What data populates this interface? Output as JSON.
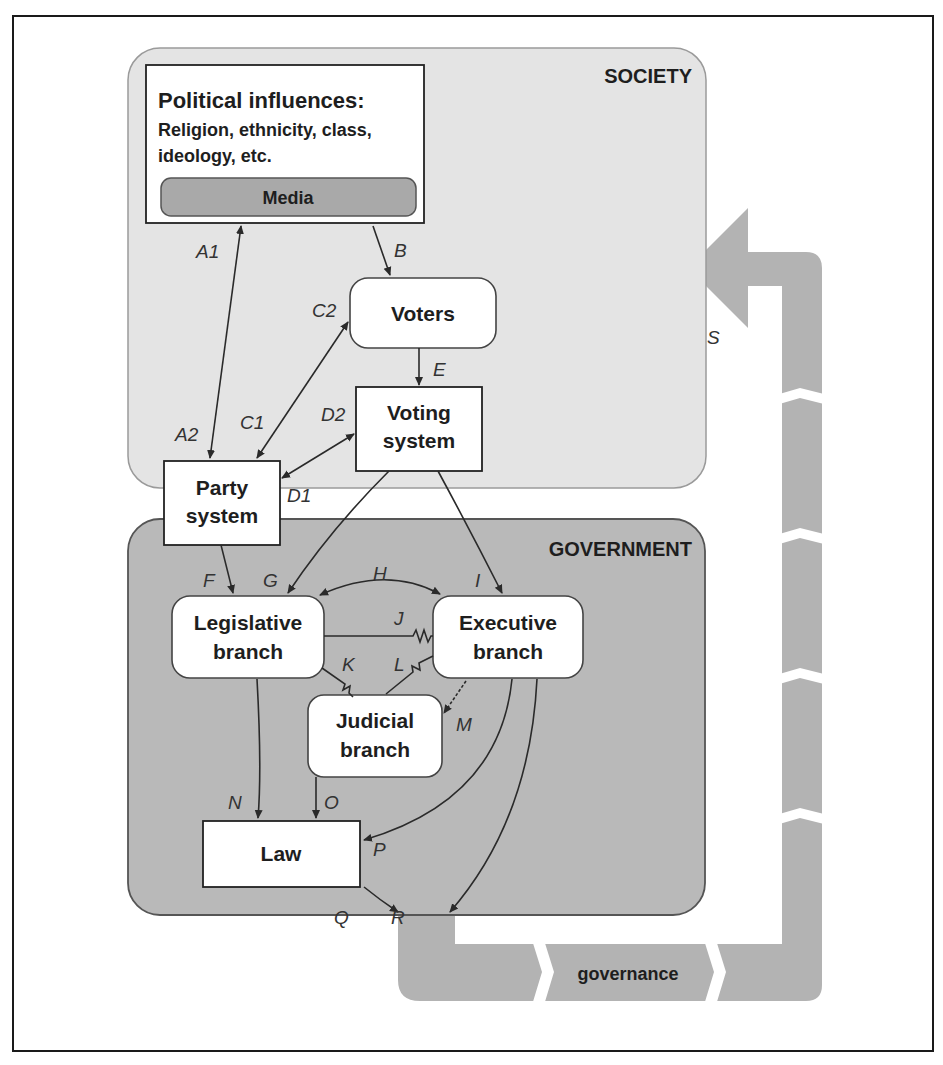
{
  "figure": {
    "regions": {
      "society": {
        "title": "SOCIETY",
        "fill": "#e4e4e4"
      },
      "government": {
        "title": "GOVERNMENT",
        "fill": "#b9b9b9"
      }
    },
    "nodes": {
      "political_influences": {
        "title": "Political influences:",
        "line1": "Religion, ethnicity, class,",
        "line2": "ideology, etc."
      },
      "media": {
        "label": "Media"
      },
      "voters": {
        "label": "Voters"
      },
      "voting_system": {
        "line1": "Voting",
        "line2": "system"
      },
      "party_system": {
        "line1": "Party",
        "line2": "system"
      },
      "legislative": {
        "line1": "Legislative",
        "line2": "branch"
      },
      "executive": {
        "line1": "Executive",
        "line2": "branch"
      },
      "judicial": {
        "line1": "Judicial",
        "line2": "branch"
      },
      "law": {
        "label": "Law"
      }
    },
    "edge_labels": {
      "A1": "A1",
      "A2": "A2",
      "B": "B",
      "C1": "C1",
      "C2": "C2",
      "D1": "D1",
      "D2": "D2",
      "E": "E",
      "F": "F",
      "G": "G",
      "H": "H",
      "I": "I",
      "J": "J",
      "K": "K",
      "L": "L",
      "M": "M",
      "N": "N",
      "O": "O",
      "P": "P",
      "Q": "Q",
      "R": "R",
      "S": "S"
    },
    "feedback_arrow": {
      "label": "governance",
      "fill": "#b3b3b3"
    }
  }
}
